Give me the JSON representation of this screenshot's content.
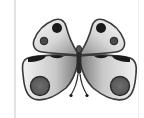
{
  "image": {
    "subject": "butterfly",
    "alt": "Gray butterfly clipart"
  },
  "colors": {
    "background": "#ffffff",
    "guide_left": "#e4e4e4",
    "guide_right": "#f0f0f0",
    "outline": "#3a3a3a",
    "wing_light": "#f4f4f4",
    "wing_dark": "#9a9a9a",
    "spot_black": "#1a1a1a",
    "spot_gray": "#5e5e5e",
    "body": "#2a2a2a"
  }
}
